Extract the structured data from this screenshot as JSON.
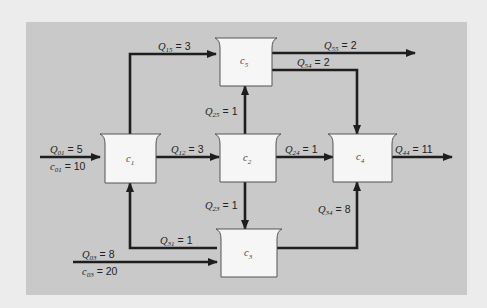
{
  "diagram": {
    "colors": {
      "background": "#ececec",
      "panel": "#c9c9c9",
      "reactor_fill": "#f6f6f6",
      "line": "#1e1e1e"
    },
    "reactors": [
      {
        "id": "c1",
        "symbol": "c",
        "sub": "1"
      },
      {
        "id": "c2",
        "symbol": "c",
        "sub": "2"
      },
      {
        "id": "c3",
        "symbol": "c",
        "sub": "3"
      },
      {
        "id": "c4",
        "symbol": "c",
        "sub": "4"
      },
      {
        "id": "c5",
        "symbol": "c",
        "sub": "5"
      }
    ],
    "flows": {
      "q01": {
        "symbol": "Q",
        "sub": "01",
        "value": "= 5"
      },
      "c01": {
        "symbol": "c",
        "sub": "01",
        "value": "= 10"
      },
      "q03": {
        "symbol": "Q",
        "sub": "03",
        "value": "= 8"
      },
      "c03": {
        "symbol": "c",
        "sub": "03",
        "value": "= 20"
      },
      "q12": {
        "symbol": "Q",
        "sub": "12",
        "value": "= 3"
      },
      "q15": {
        "symbol": "Q",
        "sub": "15",
        "value": "= 3"
      },
      "q23": {
        "symbol": "Q",
        "sub": "23",
        "value": "= 1"
      },
      "q24": {
        "symbol": "Q",
        "sub": "24",
        "value": "= 1"
      },
      "q25": {
        "symbol": "Q",
        "sub": "25",
        "value": "= 1"
      },
      "q31": {
        "symbol": "Q",
        "sub": "31",
        "value": "= 1"
      },
      "q34": {
        "symbol": "Q",
        "sub": "34",
        "value": "= 8"
      },
      "q44": {
        "symbol": "Q",
        "sub": "44",
        "value": "= 11"
      },
      "q54": {
        "symbol": "Q",
        "sub": "54",
        "value": "= 2"
      },
      "q55": {
        "symbol": "Q",
        "sub": "55",
        "value": "= 2"
      }
    }
  }
}
